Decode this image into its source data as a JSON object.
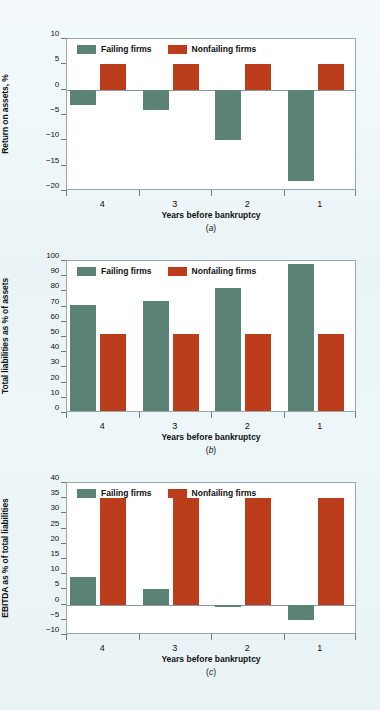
{
  "figure": {
    "background_color": "#eff7f8",
    "series_colors": {
      "failing": "#5b8375",
      "nonfailing": "#bc3d1c"
    },
    "legend": {
      "failing_label": "Failing firms",
      "nonfailing_label": "Nonfailing firms"
    }
  },
  "panels": [
    {
      "id": "a",
      "caption": "(a)",
      "caption_letter": "a",
      "ylabel": "Return on assets, %",
      "xlabel": "Years before bankruptcy",
      "yticks": [
        "10",
        "5",
        "0",
        "-5",
        "-10",
        "-15",
        "-20"
      ],
      "xticks": [
        "4",
        "3",
        "2",
        "1"
      ]
    },
    {
      "id": "b",
      "caption": "(b)",
      "caption_letter": "b",
      "ylabel": "Total liabilities as % of assets",
      "xlabel": "Years before bankruptcy",
      "yticks": [
        "100",
        "90",
        "80",
        "70",
        "60",
        "50",
        "40",
        "30",
        "20",
        "10",
        "0"
      ],
      "xticks": [
        "4",
        "3",
        "2",
        "1"
      ]
    },
    {
      "id": "c",
      "caption": "(c)",
      "caption_letter": "c",
      "ylabel": "EBITDA as % of total liabilities",
      "xlabel": "Years before bankruptcy",
      "yticks": [
        "40",
        "35",
        "30",
        "25",
        "20",
        "15",
        "10",
        "5",
        "0",
        "-5",
        "-10"
      ],
      "xticks": [
        "4",
        "3",
        "2",
        "1"
      ]
    }
  ],
  "chart_data": [
    {
      "type": "bar",
      "panel": "a",
      "title": "",
      "xlabel": "Years before bankruptcy",
      "ylabel": "Return on assets, %",
      "categories": [
        "4",
        "3",
        "2",
        "1"
      ],
      "series": [
        {
          "name": "Failing firms",
          "color": "#5b8375",
          "values": [
            -3,
            -4,
            -10,
            -18
          ]
        },
        {
          "name": "Nonfailing firms",
          "color": "#bc3d1c",
          "values": [
            5,
            5,
            5,
            5
          ]
        }
      ],
      "ylim": [
        -20,
        10
      ],
      "ytick_values": [
        10,
        5,
        0,
        -5,
        -10,
        -15,
        -20
      ],
      "grid": false,
      "legend_position": "inside-top-left"
    },
    {
      "type": "bar",
      "panel": "b",
      "title": "",
      "xlabel": "Years before bankruptcy",
      "ylabel": "Total liabilities as % of assets",
      "categories": [
        "4",
        "3",
        "2",
        "1"
      ],
      "series": [
        {
          "name": "Failing firms",
          "color": "#5b8375",
          "values": [
            71,
            74,
            82,
            98
          ]
        },
        {
          "name": "Nonfailing firms",
          "color": "#bc3d1c",
          "values": [
            52,
            52,
            52,
            52
          ]
        }
      ],
      "ylim": [
        0,
        100
      ],
      "ytick_values": [
        100,
        90,
        80,
        70,
        60,
        50,
        40,
        30,
        20,
        10,
        0
      ],
      "grid": false,
      "legend_position": "inside-top-left"
    },
    {
      "type": "bar",
      "panel": "c",
      "title": "",
      "xlabel": "Years before bankruptcy",
      "ylabel": "EBITDA as % of total liabilities",
      "categories": [
        "4",
        "3",
        "2",
        "1"
      ],
      "series": [
        {
          "name": "Failing firms",
          "color": "#5b8375",
          "values": [
            9,
            5,
            -0.7,
            -5
          ]
        },
        {
          "name": "Nonfailing firms",
          "color": "#bc3d1c",
          "values": [
            35,
            35,
            35,
            35
          ]
        }
      ],
      "ylim": [
        -10,
        40
      ],
      "ytick_values": [
        40,
        35,
        30,
        25,
        20,
        15,
        10,
        5,
        0,
        -5,
        -10
      ],
      "grid": false,
      "legend_position": "inside-top-left"
    }
  ]
}
